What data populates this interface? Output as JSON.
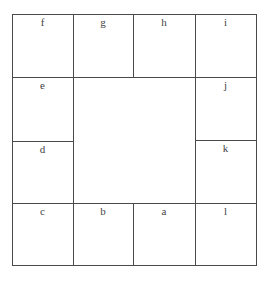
{
  "diagram": {
    "cells": {
      "f": "f",
      "g": "g",
      "h": "h",
      "i": "i",
      "e": "e",
      "j": "j",
      "d": "d",
      "k": "k",
      "c": "c",
      "b": "b",
      "a": "a",
      "l": "l"
    },
    "layout": {
      "top_row": [
        "f",
        "g",
        "h",
        "i"
      ],
      "left_column": [
        "e",
        "d"
      ],
      "right_column": [
        "j",
        "k"
      ],
      "bottom_row": [
        "c",
        "b",
        "a",
        "l"
      ]
    },
    "colors": {
      "line": "#4a4a4a",
      "text": "#444444",
      "background": "#ffffff"
    }
  }
}
